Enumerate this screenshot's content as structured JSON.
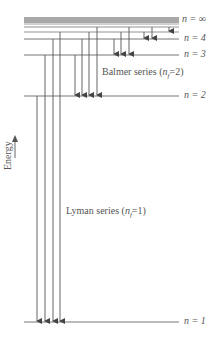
{
  "diagram": {
    "axis_label": "Energy",
    "levels": [
      {
        "label": "n = ∞",
        "n": "∞",
        "y": 21
      },
      {
        "label": "n = 4",
        "n": "4",
        "y": 39
      },
      {
        "label": "n = 3",
        "n": "3",
        "y": 55
      },
      {
        "label": "n = 2",
        "n": "2",
        "y": 96
      },
      {
        "label": "n = 1",
        "n": "1",
        "y": 322
      }
    ],
    "extra_levels_y": [
      18,
      20,
      22,
      24,
      27,
      32
    ],
    "series": [
      {
        "name": "Lyman series",
        "nf_label": "(n_f = 1)",
        "text": "Lyman series (nf=1)",
        "final_n": 1,
        "arrow_x": [
          37,
          45,
          53,
          60
        ]
      },
      {
        "name": "Balmer series",
        "nf_label": "(n_f = 2)",
        "text": "Balmer series (nf=2)",
        "final_n": 2,
        "arrow_x": [
          75,
          82,
          89,
          97
        ]
      },
      {
        "name": "Paschen",
        "final_n": 3,
        "arrow_x": [
          114,
          121,
          129
        ]
      },
      {
        "name": "Brackett",
        "final_n": 4,
        "arrow_x": [
          144,
          152
        ]
      },
      {
        "name": "Pfund",
        "final_n": 5,
        "arrow_x": [
          169
        ]
      }
    ],
    "labels": {
      "n_inf": "n = ∞",
      "n4": "n = 4",
      "n3": "n = 3",
      "n2": "n = 2",
      "n1": "n = 1",
      "balmer_name": "Balmer series",
      "balmer_paren_open": "(",
      "balmer_n": "n",
      "balmer_sub": "f",
      "balmer_eq": "=2)",
      "lyman_name": "Lyman series",
      "lyman_paren_open": "(",
      "lyman_n": "n",
      "lyman_sub": "f",
      "lyman_eq": "=1)",
      "energy": "Energy"
    },
    "colors": {
      "line": "#555555",
      "band": "#9a9a9a",
      "text": "#555555"
    }
  }
}
